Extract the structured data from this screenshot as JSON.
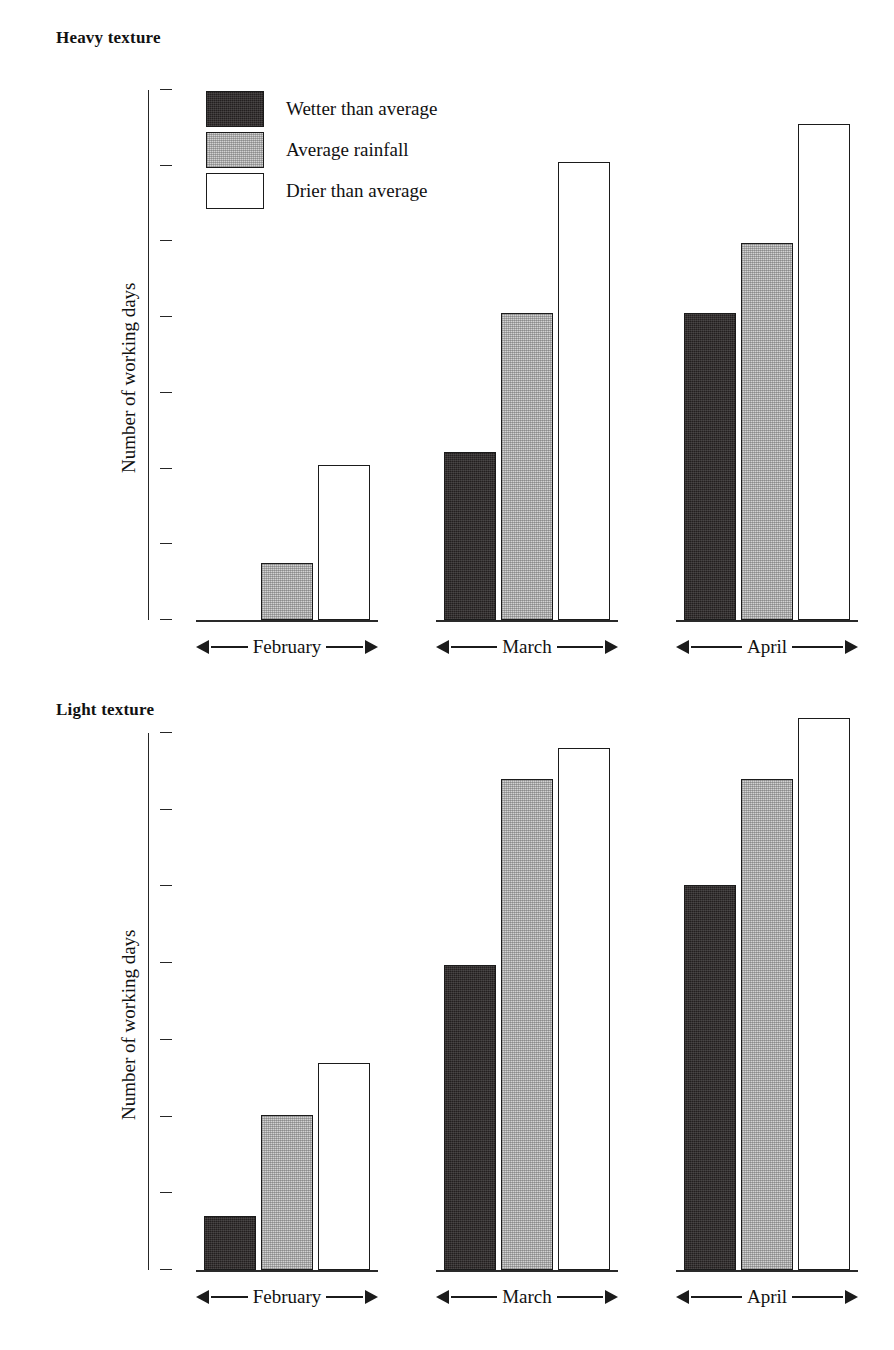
{
  "page": {
    "background": "#ffffff",
    "ink": "#111111"
  },
  "legend": {
    "position": "top-left-inside-plot",
    "entries": [
      {
        "label": "Wetter than average",
        "swatch": "dark-hatch-swatch",
        "color": "#231f1f"
      },
      {
        "label": "Average rainfall",
        "swatch": "gray-hatch-swatch",
        "color": "#d2d2d2"
      },
      {
        "label": "Drier than average",
        "swatch": "white-swatch",
        "color": "#ffffff"
      }
    ]
  },
  "panels": [
    {
      "id": "heavy",
      "title": "Heavy texture",
      "ylabel": "Number of working days",
      "yticks": [
        "28",
        "24",
        "20",
        "16",
        "12",
        "8",
        "4",
        "0"
      ],
      "groups": [
        "February",
        "March",
        "April"
      ]
    },
    {
      "id": "light",
      "title": "Light texture",
      "ylabel": "Number of working days",
      "yticks": [
        "28",
        "24",
        "20",
        "16",
        "12",
        "8",
        "4",
        "0"
      ],
      "groups": [
        "February",
        "March",
        "April"
      ]
    }
  ],
  "chart_data": [
    {
      "type": "bar",
      "title": "Heavy texture",
      "xlabel": "",
      "ylabel": "Number of working days",
      "categories": [
        "February",
        "March",
        "April"
      ],
      "ylim": [
        0,
        28
      ],
      "yticks": [
        0,
        4,
        8,
        12,
        16,
        20,
        24,
        28
      ],
      "grid": false,
      "legend_position": "upper left",
      "series": [
        {
          "name": "Wetter than average",
          "color": "#231f1f",
          "values": [
            0,
            8.9,
            16.2
          ]
        },
        {
          "name": "Average rainfall",
          "color": "#d2d2d2",
          "values": [
            3.0,
            16.2,
            19.9
          ]
        },
        {
          "name": "Drier than average",
          "color": "#ffffff",
          "values": [
            8.2,
            24.2,
            26.2
          ]
        }
      ]
    },
    {
      "type": "bar",
      "title": "Light texture",
      "xlabel": "",
      "ylabel": "Number of working days",
      "categories": [
        "February",
        "March",
        "April"
      ],
      "ylim": [
        0,
        28
      ],
      "yticks": [
        0,
        4,
        8,
        12,
        16,
        20,
        24,
        28
      ],
      "grid": false,
      "legend_position": "none",
      "series": [
        {
          "name": "Wetter than average",
          "color": "#231f1f",
          "values": [
            2.8,
            15.9,
            20.1
          ]
        },
        {
          "name": "Average rainfall",
          "color": "#d2d2d2",
          "values": [
            8.1,
            25.6,
            25.6
          ]
        },
        {
          "name": "Drier than average",
          "color": "#ffffff",
          "values": [
            10.8,
            27.2,
            28.8
          ]
        }
      ]
    }
  ]
}
